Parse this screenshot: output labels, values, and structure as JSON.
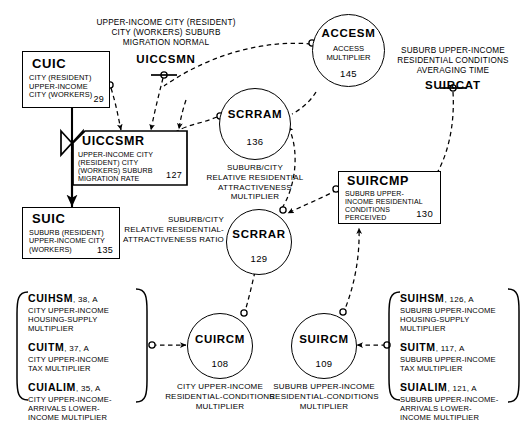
{
  "diagram": {
    "levels": [
      {
        "id": "CUIC",
        "name": "CUIC",
        "desc": "CITY (RESIDENT)\nUPPER-INCOME\nCITY (WORKERS)",
        "number": "29"
      },
      {
        "id": "SUIC",
        "name": "SUIC",
        "desc": "SUBURB (RESIDENT)\nUPPER-INCOME CITY\n(WORKERS)",
        "number": "135"
      },
      {
        "id": "SUIRCMP",
        "name": "SUIRCMP",
        "desc": "SUBURB UPPER-\nINCOME RESIDENTIAL\nCONDITIONS\nPERCEIVED",
        "number": "130"
      }
    ],
    "rates": [
      {
        "id": "UICCSMR",
        "name": "UICCSMR",
        "desc": "UPPER-INCOME CITY\n(RESIDENT) CITY\n(WORKERS) SUBURB\nMIGRATION RATE",
        "number": "127"
      }
    ],
    "auxiliaries": [
      {
        "id": "ACCESM",
        "name": "ACCESM",
        "inner": "ACCESS\nMULTIPLIER",
        "number": "145",
        "caption": ""
      },
      {
        "id": "SCRRAM",
        "name": "SCRRAM",
        "inner": "",
        "number": "136",
        "caption": "SUBURB/CITY\nRELATIVE RESIDENTIAL\nATTRACTIVENESS\nMULTIPLIER"
      },
      {
        "id": "SCRRAR",
        "name": "SCRRAR",
        "inner": "",
        "number": "129",
        "caption": "SUBURB/CITY\nRELATIVE RESIDENTIAL-\nATTRACTIVENESS RATIO"
      },
      {
        "id": "CUIRCM",
        "name": "CUIRCM",
        "inner": "",
        "number": "108",
        "caption": "CITY UPPER-INCOME\nRESIDENTIAL-CONDITIONS\nMULTIPLIER"
      },
      {
        "id": "SUIRCM",
        "name": "SUIRCM",
        "inner": "",
        "number": "109",
        "caption": "SUBURB UPPER-INCOME\nRESIDENTIAL-CONDITIONS\nMULTIPLIER"
      }
    ],
    "constants": [
      {
        "id": "UICCSMN",
        "name": "UICCSMN",
        "caption": "UPPER-INCOME CITY (RESIDENT)\nCITY (WORKERS) SUBURB\nMIGRATION NORMAL"
      },
      {
        "id": "SUIRCAT",
        "name": "SUIRCAT",
        "caption": "SUBURB UPPER-INCOME\nRESIDENTIAL CONDITIONS\nAVERAGING TIME"
      }
    ],
    "brace_groups": [
      {
        "id": "city-inputs",
        "items": [
          {
            "name": "CUIHSM",
            "meta": ", 38, A",
            "desc": "CITY UPPER-INCOME\nHOUSING-SUPPLY\nMULTIPLIER"
          },
          {
            "name": "CUITM",
            "meta": ", 37, A",
            "desc": "CITY UPPER-INCOME\nTAX MULTIPLIER"
          },
          {
            "name": "CUIALIM",
            "meta": ", 35, A",
            "desc": "CITY UPPER-INCOME-\nARRIVALS LOWER-\nINCOME MULTIPLIER"
          }
        ]
      },
      {
        "id": "suburb-inputs",
        "items": [
          {
            "name": "SUIHSM",
            "meta": ", 126, A",
            "desc": "SUBURB UPPER-INCOME\nHOUSING-SUPPLY\nMULTIPLIER"
          },
          {
            "name": "SUITM",
            "meta": ", 117, A",
            "desc": "SUBURB UPPER-INCOME\nTAX MULTIPLIER"
          },
          {
            "name": "SUIALIM",
            "meta": ", 121, A",
            "desc": "SUBURB UPPER-INCOME-\nARRIVALS LOWER-\nINCOME MULTIPLIER"
          }
        ]
      }
    ],
    "colors": {
      "ink": "#000000",
      "paper": "#ffffff"
    }
  }
}
